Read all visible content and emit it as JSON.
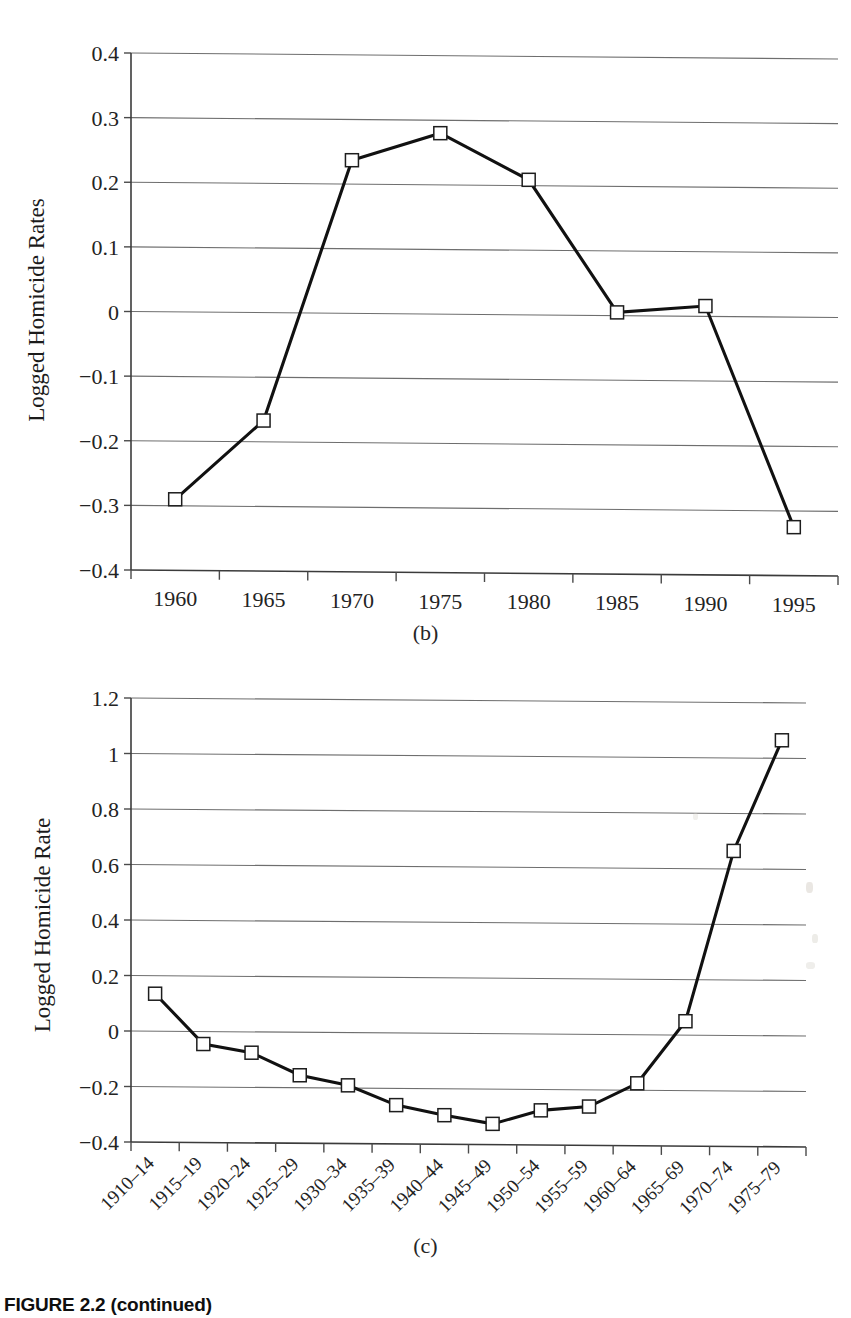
{
  "figure": {
    "caption": "FIGURE 2.2 (continued)",
    "panel_b_label": "(b)",
    "panel_c_label": "(c)"
  },
  "chart_data": [
    {
      "id": "panel-b",
      "type": "line",
      "title": "",
      "xlabel": "",
      "ylabel": "Logged Homicide Rates",
      "categories": [
        "1960",
        "1965",
        "1970",
        "1975",
        "1980",
        "1985",
        "1990",
        "1995"
      ],
      "values": [
        -0.29,
        -0.167,
        0.237,
        0.28,
        0.209,
        0.005,
        0.016,
        -0.325
      ],
      "ytick_labels": [
        "0.4",
        "0.3",
        "0.2",
        "0.1",
        "0",
        "-0.1",
        "-0.2",
        "-0.3",
        "-0.4"
      ],
      "ytick_values": [
        0.4,
        0.3,
        0.2,
        0.1,
        0,
        -0.1,
        -0.2,
        -0.3,
        -0.4
      ],
      "ylim": [
        -0.4,
        0.4
      ],
      "grid": true,
      "legend": "none",
      "marker": "open-square"
    },
    {
      "id": "panel-c",
      "type": "line",
      "title": "",
      "xlabel": "",
      "ylabel": "Logged Homicide Rate",
      "categories": [
        "1910–14",
        "1915–19",
        "1920–24",
        "1925–29",
        "1930–34",
        "1935–39",
        "1940–44",
        "1945–49",
        "1950–54",
        "1955–59",
        "1960–64",
        "1965–69",
        "1970–74",
        "1975–79"
      ],
      "values": [
        0.135,
        -0.045,
        -0.075,
        -0.155,
        -0.19,
        -0.26,
        -0.295,
        -0.325,
        -0.275,
        -0.26,
        -0.175,
        0.05,
        0.665,
        1.065
      ],
      "ytick_labels": [
        "1.2",
        "1",
        "0.8",
        "0.6",
        "0.4",
        "0.2",
        "0",
        "-0.2",
        "-0.4"
      ],
      "ytick_values": [
        1.2,
        1.0,
        0.8,
        0.6,
        0.4,
        0.2,
        0,
        -0.2,
        -0.4
      ],
      "ylim": [
        -0.4,
        1.2
      ],
      "grid": true,
      "legend": "none",
      "marker": "open-square"
    }
  ]
}
